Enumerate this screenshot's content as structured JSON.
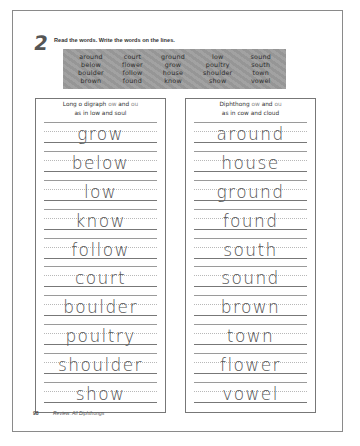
{
  "exercise": {
    "number": "2",
    "instruction": "Read the words. Write the words on the lines."
  },
  "word_bank": {
    "columns": [
      [
        "around",
        "below",
        "boulder",
        "brown"
      ],
      [
        "court",
        "flower",
        "follow",
        "found"
      ],
      [
        "ground",
        "grow",
        "house",
        "know"
      ],
      [
        "low",
        "poultry",
        "shoulder",
        "show"
      ],
      [
        "sound",
        "south",
        "town",
        "vowel"
      ]
    ]
  },
  "left_column": {
    "heading_line1_a": "Long o digraph",
    "heading_line1_b": "ow",
    "heading_line1_c": "and",
    "heading_line1_d": "ou",
    "heading_line2": "as in low and soul",
    "words": [
      "grow",
      "below",
      "low",
      "know",
      "follow",
      "court",
      "boulder",
      "poultry",
      "shoulder",
      "show"
    ]
  },
  "right_column": {
    "heading_line1_a": "Diphthong",
    "heading_line1_b": "ow",
    "heading_line1_c": "and",
    "heading_line1_d": "ou",
    "heading_line2": "as in cow and cloud",
    "words": [
      "around",
      "house",
      "ground",
      "found",
      "south",
      "sound",
      "brown",
      "town",
      "flower",
      "vowel"
    ]
  },
  "footer": {
    "page_number": "98",
    "text": "Review: All Diphthongs"
  }
}
